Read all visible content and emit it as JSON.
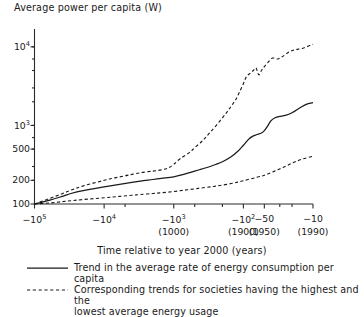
{
  "chart_data": {
    "type": "line",
    "title": "",
    "ylabel": "Average power per capita (W)",
    "xlabel": "Time relative to year 2000 (years)",
    "grid": false,
    "legend_position": "below",
    "yscale": "log",
    "xscale": "negative-log",
    "ylim": [
      100,
      15000
    ],
    "y_ticks": [
      {
        "value": 10000,
        "label": "10",
        "exp": "4"
      },
      {
        "value": 1000,
        "label": "10",
        "exp": "3"
      },
      {
        "value": 500,
        "label": "500",
        "exp": ""
      },
      {
        "value": 200,
        "label": "200",
        "exp": ""
      },
      {
        "value": 100,
        "label": "100",
        "exp": ""
      }
    ],
    "y_minor_ticks": [
      200,
      300,
      500,
      700,
      1000,
      2000,
      3000,
      5000,
      7000,
      10000
    ],
    "x_ticks": [
      {
        "label": "−10",
        "exp": "5",
        "year": ""
      },
      {
        "label": "−10",
        "exp": "4",
        "year": ""
      },
      {
        "label": "−10",
        "exp": "3",
        "year": "(1000)"
      },
      {
        "label": "−10",
        "exp": "2",
        "year": "(1900)"
      },
      {
        "label": "−50",
        "exp": "",
        "year": "(1950)"
      },
      {
        "label": "−10",
        "exp": "",
        "year": "(1990)"
      }
    ],
    "series": [
      {
        "name": "Trend in the average rate of energy consumption per capita",
        "style": "solid",
        "points": [
          [
            -100000,
            100
          ],
          [
            -60000,
            112
          ],
          [
            -40000,
            125
          ],
          [
            -30000,
            136
          ],
          [
            -20000,
            148
          ],
          [
            -10000,
            165
          ],
          [
            -6000,
            178
          ],
          [
            -4000,
            188
          ],
          [
            -3000,
            196
          ],
          [
            -2000,
            205
          ],
          [
            -1500,
            212
          ],
          [
            -1000,
            222
          ],
          [
            -700,
            240
          ],
          [
            -500,
            262
          ],
          [
            -400,
            278
          ],
          [
            -300,
            300
          ],
          [
            -250,
            318
          ],
          [
            -200,
            345
          ],
          [
            -150,
            400
          ],
          [
            -120,
            470
          ],
          [
            -100,
            560
          ],
          [
            -85,
            660
          ],
          [
            -75,
            720
          ],
          [
            -65,
            760
          ],
          [
            -55,
            800
          ],
          [
            -50,
            860
          ],
          [
            -45,
            980
          ],
          [
            -40,
            1150
          ],
          [
            -35,
            1250
          ],
          [
            -30,
            1300
          ],
          [
            -25,
            1340
          ],
          [
            -20,
            1450
          ],
          [
            -15,
            1700
          ],
          [
            -12,
            1880
          ],
          [
            -10,
            1950
          ]
        ]
      },
      {
        "name": "Highest average energy usage",
        "style": "dashed",
        "points": [
          [
            -100000,
            100
          ],
          [
            -60000,
            118
          ],
          [
            -40000,
            135
          ],
          [
            -30000,
            150
          ],
          [
            -20000,
            170
          ],
          [
            -10000,
            200
          ],
          [
            -7000,
            215
          ],
          [
            -5000,
            228
          ],
          [
            -4000,
            238
          ],
          [
            -3000,
            250
          ],
          [
            -2000,
            262
          ],
          [
            -1500,
            272
          ],
          [
            -1200,
            288
          ],
          [
            -1000,
            320
          ],
          [
            -800,
            380
          ],
          [
            -600,
            450
          ],
          [
            -500,
            520
          ],
          [
            -400,
            620
          ],
          [
            -350,
            700
          ],
          [
            -300,
            820
          ],
          [
            -250,
            980
          ],
          [
            -200,
            1250
          ],
          [
            -170,
            1500
          ],
          [
            -150,
            1750
          ],
          [
            -130,
            2100
          ],
          [
            -115,
            2600
          ],
          [
            -100,
            3400
          ],
          [
            -90,
            4200
          ],
          [
            -80,
            4600
          ],
          [
            -72,
            5000
          ],
          [
            -66,
            5400
          ],
          [
            -60,
            4400
          ],
          [
            -55,
            5000
          ],
          [
            -50,
            5600
          ],
          [
            -44,
            6400
          ],
          [
            -38,
            7200
          ],
          [
            -32,
            7000
          ],
          [
            -27,
            7600
          ],
          [
            -22,
            8600
          ],
          [
            -18,
            9200
          ],
          [
            -14,
            9600
          ],
          [
            -10,
            10800
          ]
        ]
      },
      {
        "name": "Lowest average energy usage",
        "style": "dashed",
        "points": [
          [
            -100000,
            100
          ],
          [
            -60000,
            103
          ],
          [
            -40000,
            107
          ],
          [
            -30000,
            110
          ],
          [
            -20000,
            114
          ],
          [
            -10000,
            120
          ],
          [
            -6000,
            125
          ],
          [
            -4000,
            129
          ],
          [
            -3000,
            132
          ],
          [
            -2000,
            136
          ],
          [
            -1500,
            139
          ],
          [
            -1000,
            144
          ],
          [
            -700,
            150
          ],
          [
            -500,
            156
          ],
          [
            -400,
            160
          ],
          [
            -300,
            165
          ],
          [
            -250,
            169
          ],
          [
            -200,
            174
          ],
          [
            -150,
            182
          ],
          [
            -120,
            190
          ],
          [
            -100,
            198
          ],
          [
            -80,
            208
          ],
          [
            -65,
            218
          ],
          [
            -55,
            226
          ],
          [
            -50,
            232
          ],
          [
            -44,
            242
          ],
          [
            -38,
            256
          ],
          [
            -32,
            272
          ],
          [
            -27,
            292
          ],
          [
            -22,
            318
          ],
          [
            -18,
            345
          ],
          [
            -14,
            375
          ],
          [
            -10,
            405
          ]
        ]
      }
    ],
    "legend": [
      {
        "style": "solid",
        "lines": [
          "Trend in the average rate of energy consumption per capita"
        ]
      },
      {
        "style": "dashed",
        "lines": [
          "Corresponding trends for societies having the highest and the",
          "lowest average energy usage"
        ]
      }
    ]
  }
}
